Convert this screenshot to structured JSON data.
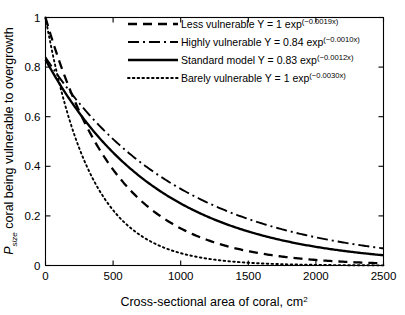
{
  "chart_data": {
    "type": "line",
    "title": "",
    "xlabel": "Cross-sectional area of coral, cm",
    "xlabel_sup": "2",
    "ylabel_prefix": "P",
    "ylabel_sub": "size",
    "ylabel_rest": " coral being vulnerable to overgrowth",
    "xlim": [
      0,
      2500
    ],
    "ylim": [
      0,
      1
    ],
    "xticks": [
      0,
      500,
      1000,
      1500,
      2000,
      2500
    ],
    "xticklabels": [
      "0",
      "500",
      "1000",
      "1500",
      "2000",
      "2500"
    ],
    "yticks": [
      0,
      0.2,
      0.4,
      0.6,
      0.8,
      1
    ],
    "yticklabels": [
      "0",
      "0.2",
      "0.4",
      "0.6",
      "0.8",
      "1"
    ],
    "grid": false,
    "legend_position": "top-right-inside",
    "series": [
      {
        "name": "Less vulnerable",
        "label_text": "Less vulnerable Y = 1 exp",
        "label_sup": "(−0.0019x)",
        "style": "dashed",
        "amplitude": 1,
        "rate": 0.0019,
        "x": [
          0,
          125,
          250,
          375,
          500,
          625,
          750,
          875,
          1000,
          1125,
          1250,
          1375,
          1500,
          1625,
          1750,
          1875,
          2000,
          2125,
          2250,
          2375,
          2500
        ],
        "y": [
          1.0,
          0.789,
          0.623,
          0.491,
          0.387,
          0.305,
          0.241,
          0.19,
          0.15,
          0.118,
          0.093,
          0.074,
          0.058,
          0.046,
          0.036,
          0.028,
          0.022,
          0.018,
          0.014,
          0.011,
          0.0087
        ]
      },
      {
        "name": "Highly vulnerable",
        "label_text": "Highly vulnerable Y = 0.84 exp",
        "label_sup": "(−0.0010x)",
        "style": "dashdot",
        "amplitude": 0.84,
        "rate": 0.001,
        "x": [
          0,
          125,
          250,
          375,
          500,
          625,
          750,
          875,
          1000,
          1125,
          1250,
          1375,
          1500,
          1625,
          1750,
          1875,
          2000,
          2125,
          2250,
          2375,
          2500
        ],
        "y": [
          0.84,
          0.741,
          0.654,
          0.577,
          0.509,
          0.449,
          0.397,
          0.35,
          0.309,
          0.273,
          0.241,
          0.212,
          0.187,
          0.165,
          0.146,
          0.129,
          0.114,
          0.1,
          0.088,
          0.078,
          0.069
        ]
      },
      {
        "name": "Standard model",
        "label_text": "Standard model Y = 0.83 exp",
        "label_sup": "(−0.0012x)",
        "style": "solid",
        "amplitude": 0.83,
        "rate": 0.0012,
        "x": [
          0,
          125,
          250,
          375,
          500,
          625,
          750,
          875,
          1000,
          1125,
          1250,
          1375,
          1500,
          1625,
          1750,
          1875,
          2000,
          2125,
          2250,
          2375,
          2500
        ],
        "y": [
          0.83,
          0.715,
          0.615,
          0.53,
          0.456,
          0.392,
          0.337,
          0.29,
          0.25,
          0.215,
          0.185,
          0.159,
          0.137,
          0.118,
          0.102,
          0.088,
          0.075,
          0.065,
          0.056,
          0.048,
          0.041
        ]
      },
      {
        "name": "Barely vulnerable",
        "label_text": "Barely vulnerable Y = 1 exp",
        "label_sup": "(−0.0030x)",
        "style": "dotted",
        "amplitude": 1,
        "rate": 0.003,
        "x": [
          0,
          125,
          250,
          375,
          500,
          625,
          750,
          875,
          1000,
          1125,
          1250,
          1375,
          1500,
          1625,
          1750,
          1875,
          2000,
          2125,
          2250,
          2375,
          2500
        ],
        "y": [
          1.0,
          0.687,
          0.472,
          0.325,
          0.223,
          0.153,
          0.105,
          0.073,
          0.05,
          0.034,
          0.024,
          0.016,
          0.011,
          0.0076,
          0.0052,
          0.0036,
          0.0025,
          0.0017,
          0.0012,
          0.0008,
          0.00055
        ]
      }
    ]
  }
}
